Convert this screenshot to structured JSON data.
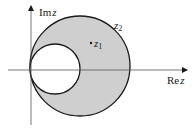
{
  "diagram": {
    "type": "complex-plane-region",
    "colors": {
      "shade": "#cfcfcf",
      "stroke": "#1a1a1a",
      "background": "#ffffff"
    },
    "axes": {
      "imag_label_prefix": "Im",
      "imag_label_var": "z",
      "real_label_prefix": "Re",
      "real_label_var": "z"
    },
    "outer_circle": {
      "label_base": "z",
      "label_sub": "2"
    },
    "point": {
      "label_base": "z",
      "label_sub": "1"
    }
  }
}
